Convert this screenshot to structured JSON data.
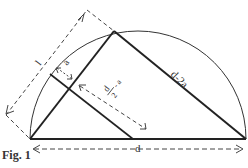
{
  "figure": {
    "caption": "Fig. 1",
    "labels": {
      "side_l": "l",
      "a": "a",
      "half_d_num": "d",
      "half_d_den": "2",
      "half_d_minus": "- a",
      "hyp": "d-2a",
      "base": "d"
    },
    "colors": {
      "line": "#222222",
      "dash": "#444444",
      "text": "#333333"
    }
  }
}
